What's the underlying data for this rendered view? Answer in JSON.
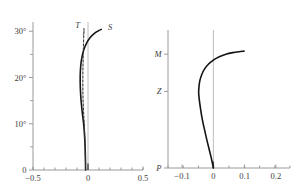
{
  "figure": {
    "background": "#ffffff",
    "curve_color": "#141414",
    "axis_color": "#9a9a9a",
    "zeroline_color": "#bdbdbd"
  },
  "chart_data": [
    {
      "id": "left",
      "type": "line",
      "title": "",
      "xlabel": "",
      "ylabel": "",
      "xlim": [
        -0.5,
        0.5
      ],
      "ylim": [
        0,
        32
      ],
      "grid": false,
      "legend_position": "inline-annotation",
      "xticks": [
        -0.5,
        0,
        0.5
      ],
      "xticklabels": [
        "−0.5",
        "0",
        "0.5"
      ],
      "xminor_count": 9,
      "yticks": [
        0,
        5,
        10,
        15,
        20,
        25,
        30
      ],
      "yticklabels": [
        "0",
        "",
        "10°",
        "",
        "20°",
        "",
        "30°"
      ],
      "zero_reference_x": 0,
      "series": [
        {
          "name": "S",
          "style": "solid",
          "label": "S",
          "label_x": 0.2,
          "label_y": 30.2,
          "points": [
            [
              -0.022,
              0.0
            ],
            [
              -0.023,
              2.0
            ],
            [
              -0.025,
              4.0
            ],
            [
              -0.028,
              6.0
            ],
            [
              -0.033,
              8.0
            ],
            [
              -0.04,
              10.0
            ],
            [
              -0.05,
              12.0
            ],
            [
              -0.059,
              14.0
            ],
            [
              -0.066,
              16.0
            ],
            [
              -0.07,
              18.0
            ],
            [
              -0.071,
              20.0
            ],
            [
              -0.069,
              21.5
            ],
            [
              -0.064,
              23.0
            ],
            [
              -0.054,
              24.5
            ],
            [
              -0.038,
              26.0
            ],
            [
              -0.014,
              27.4
            ],
            [
              0.018,
              28.6
            ],
            [
              0.056,
              29.5
            ],
            [
              0.095,
              30.1
            ],
            [
              0.12,
              30.4
            ]
          ]
        },
        {
          "name": "T",
          "style": "dashed",
          "label": "T",
          "label_x": -0.095,
          "label_y": 30.6,
          "leader_to_x": -0.045,
          "leader_to_y": 29.2,
          "points": [
            [
              -0.022,
              0.0
            ],
            [
              -0.023,
              2.0
            ],
            [
              -0.025,
              4.0
            ],
            [
              -0.027,
              6.0
            ],
            [
              -0.03,
              8.0
            ],
            [
              -0.034,
              10.0
            ],
            [
              -0.039,
              12.0
            ],
            [
              -0.043,
              14.0
            ],
            [
              -0.046,
              16.0
            ],
            [
              -0.047,
              18.0
            ],
            [
              -0.047,
              20.0
            ],
            [
              -0.046,
              22.0
            ],
            [
              -0.044,
              24.0
            ],
            [
              -0.042,
              26.0
            ],
            [
              -0.04,
              28.0
            ],
            [
              -0.038,
              29.6
            ],
            [
              -0.037,
              30.6
            ]
          ]
        }
      ]
    },
    {
      "id": "right",
      "type": "line",
      "title": "",
      "xlabel": "",
      "ylabel": "",
      "xlim": [
        -0.145,
        0.245
      ],
      "ylim": [
        0,
        1
      ],
      "grid": false,
      "legend_position": "none",
      "xticks": [
        -0.1,
        0,
        0.1,
        0.2
      ],
      "xticklabels": [
        "−0.1",
        "0",
        "0.1",
        "0.2"
      ],
      "xminor_count": 7,
      "yticks": [
        0,
        0.555,
        0.825
      ],
      "yticklabels": [
        "P",
        "Z",
        "M"
      ],
      "zero_reference_x": 0,
      "series": [
        {
          "name": "profile",
          "style": "solid",
          "label": "",
          "points": [
            [
              0.0,
              0.0
            ],
            [
              -0.004,
              0.045
            ],
            [
              -0.009,
              0.095
            ],
            [
              -0.015,
              0.15
            ],
            [
              -0.022,
              0.215
            ],
            [
              -0.029,
              0.285
            ],
            [
              -0.036,
              0.36
            ],
            [
              -0.041,
              0.43
            ],
            [
              -0.045,
              0.495
            ],
            [
              -0.047,
              0.545
            ],
            [
              -0.046,
              0.59
            ],
            [
              -0.043,
              0.635
            ],
            [
              -0.037,
              0.678
            ],
            [
              -0.028,
              0.718
            ],
            [
              -0.016,
              0.752
            ],
            [
              0.0,
              0.782
            ],
            [
              0.019,
              0.806
            ],
            [
              0.04,
              0.824
            ],
            [
              0.062,
              0.836
            ],
            [
              0.082,
              0.843
            ],
            [
              0.098,
              0.847
            ]
          ]
        }
      ]
    }
  ]
}
